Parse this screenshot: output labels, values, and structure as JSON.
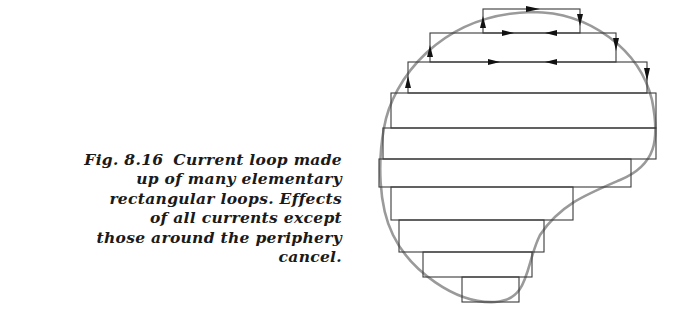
{
  "figure": {
    "number": "Fig. 8.16",
    "caption_lines": [
      "Current loop made",
      "up of many elementary",
      "rectangular loops. Effects",
      "of all currents except",
      "those around the periphery",
      "cancel."
    ],
    "colors": {
      "loop_lines": "#3a3a3a",
      "periphery_curve": "#9a9a9a",
      "arrows": "#111111",
      "text": "#1a1a1a"
    },
    "rect_rows": [
      {
        "y_top": 9,
        "y_bottom": 33,
        "x_left": 483,
        "x_right": 580
      },
      {
        "y_top": 33,
        "y_bottom": 62,
        "x_left": 430,
        "x_right": 616
      },
      {
        "y_top": 62,
        "y_bottom": 93,
        "x_left": 408,
        "x_right": 647
      },
      {
        "y_top": 93,
        "y_bottom": 128,
        "x_left": 391,
        "x_right": 656
      },
      {
        "y_top": 128,
        "y_bottom": 159,
        "x_left": 383,
        "x_right": 656
      },
      {
        "y_top": 159,
        "y_bottom": 187,
        "x_left": 379,
        "x_right": 631
      },
      {
        "y_top": 187,
        "y_bottom": 220,
        "x_left": 391,
        "x_right": 573
      },
      {
        "y_top": 220,
        "y_bottom": 252,
        "x_left": 399,
        "x_right": 544
      },
      {
        "y_top": 252,
        "y_bottom": 277,
        "x_left": 423,
        "x_right": 532
      },
      {
        "y_top": 277,
        "y_bottom": 302,
        "x_left": 462,
        "x_right": 519
      }
    ]
  }
}
